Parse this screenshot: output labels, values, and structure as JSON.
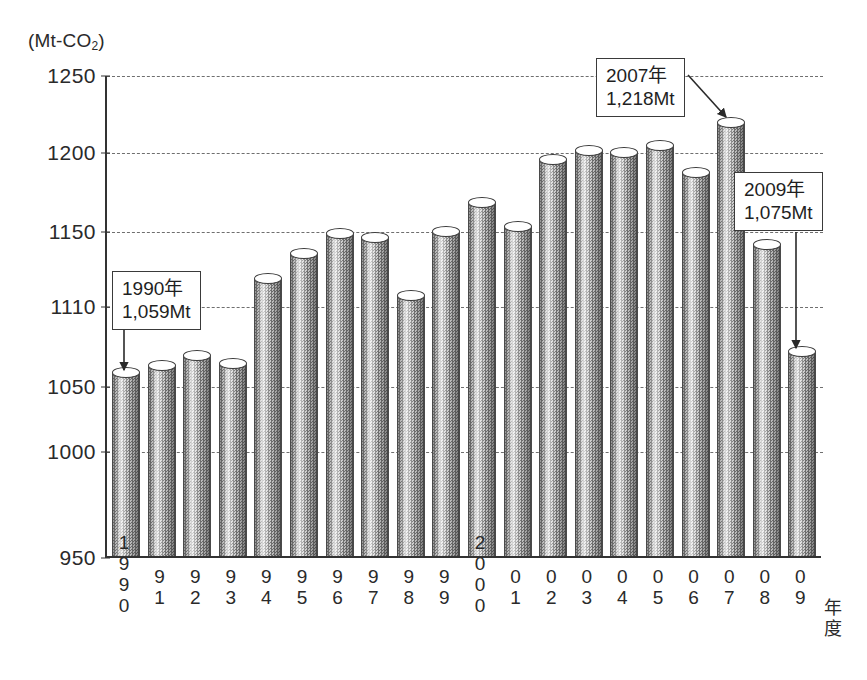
{
  "chart_data": {
    "type": "bar",
    "title": "",
    "subtitle": "",
    "xlabel": "年度",
    "ylabel": "(Mt-CO2)",
    "unit_label_main": "(Mt-CO",
    "unit_label_sub": "2",
    "unit_label_tail": ")",
    "ylim": [
      950,
      1250
    ],
    "yticks": [
      950,
      1000,
      1050,
      1110,
      1150,
      1200,
      1250
    ],
    "ytick_labels": [
      "950",
      "1000",
      "1050",
      "1110",
      "1150",
      "1200",
      "1250"
    ],
    "grid": true,
    "legend": null,
    "categories": [
      "1990",
      "1991",
      "1992",
      "1993",
      "1994",
      "1995",
      "1996",
      "1997",
      "1998",
      "1999",
      "2000",
      "2001",
      "2002",
      "2003",
      "2004",
      "2005",
      "2006",
      "2007",
      "2008",
      "2009"
    ],
    "xtick_labels": [
      [
        "1",
        "9",
        "9",
        "0"
      ],
      [
        "9",
        "1"
      ],
      [
        "9",
        "2"
      ],
      [
        "9",
        "3"
      ],
      [
        "9",
        "4"
      ],
      [
        "9",
        "5"
      ],
      [
        "9",
        "6"
      ],
      [
        "9",
        "7"
      ],
      [
        "9",
        "8"
      ],
      [
        "9",
        "9"
      ],
      [
        "2",
        "0",
        "0",
        "0"
      ],
      [
        "0",
        "1"
      ],
      [
        "0",
        "2"
      ],
      [
        "0",
        "3"
      ],
      [
        "0",
        "4"
      ],
      [
        "0",
        "5"
      ],
      [
        "0",
        "6"
      ],
      [
        "0",
        "7"
      ],
      [
        "0",
        "8"
      ],
      [
        "0",
        "9"
      ]
    ],
    "xaxis_suffix": [
      "年",
      "度"
    ],
    "values": [
      1059,
      1064,
      1072,
      1066,
      1124,
      1137,
      1148,
      1146,
      1115,
      1149,
      1167,
      1152,
      1194,
      1200,
      1199,
      1203,
      1186,
      1218,
      1142,
      1075
    ],
    "annotations": [
      {
        "id": "a1990",
        "line1": "1990年",
        "line2": "1,059Mt",
        "target_year": "1990",
        "target_value": 1059
      },
      {
        "id": "a2007",
        "line1": "2007年",
        "line2": "1,218Mt",
        "target_year": "2007",
        "target_value": 1218
      },
      {
        "id": "a2009",
        "line1": "2009年",
        "line2": "1,075Mt",
        "target_year": "2009",
        "target_value": 1075
      }
    ]
  }
}
